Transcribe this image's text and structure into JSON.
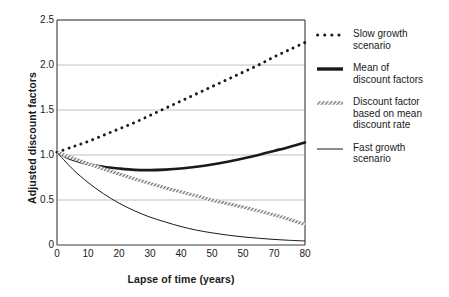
{
  "chart_data": {
    "type": "line",
    "title": "",
    "xlabel": "Lapse of time (years)",
    "ylabel": "Adjusted discount factors",
    "xlim": [
      0,
      80
    ],
    "ylim": [
      0,
      2.5
    ],
    "xticks": [
      0,
      10,
      20,
      30,
      40,
      50,
      60,
      70,
      80
    ],
    "xtick_labels": [
      "0",
      "10",
      "20",
      "30",
      "40",
      "50",
      "50",
      "70",
      "80"
    ],
    "yticks": [
      0,
      0.5,
      1.0,
      1.5,
      2.0,
      2.5
    ],
    "ytick_labels": [
      "0",
      "0.5",
      "1.0",
      "1.5",
      "2.0",
      "2.5"
    ],
    "grid": "horizontal",
    "grid_color": "#b0b0b0",
    "legend_position": "right",
    "x": [
      0,
      5,
      10,
      15,
      20,
      25,
      30,
      35,
      40,
      45,
      50,
      55,
      60,
      65,
      70,
      75,
      80
    ],
    "series": [
      {
        "name": "Slow growth scenario",
        "style": "dotted",
        "color": "#1a1a1a",
        "values": [
          1.03,
          1.09,
          1.15,
          1.22,
          1.29,
          1.36,
          1.44,
          1.52,
          1.6,
          1.68,
          1.76,
          1.84,
          1.92,
          2.0,
          2.09,
          2.17,
          2.25
        ]
      },
      {
        "name": "Mean of discount factors",
        "style": "thick-solid",
        "color": "#1a1a1a",
        "values": [
          1.03,
          0.95,
          0.9,
          0.87,
          0.85,
          0.835,
          0.832,
          0.838,
          0.85,
          0.87,
          0.895,
          0.925,
          0.96,
          1.0,
          1.045,
          1.09,
          1.14
        ]
      },
      {
        "name": "Discount factor based on mean discount rate",
        "style": "hatched",
        "color": "#8c8c8c",
        "values": [
          1.03,
          0.965,
          0.905,
          0.845,
          0.79,
          0.735,
          0.685,
          0.635,
          0.59,
          0.545,
          0.5,
          0.46,
          0.42,
          0.38,
          0.335,
          0.285,
          0.225
        ]
      },
      {
        "name": "Fast growth scenario",
        "style": "thin-solid",
        "color": "#1a1a1a",
        "values": [
          1.03,
          0.845,
          0.695,
          0.57,
          0.465,
          0.38,
          0.31,
          0.255,
          0.205,
          0.165,
          0.135,
          0.11,
          0.09,
          0.075,
          0.062,
          0.052,
          0.045
        ]
      }
    ]
  },
  "legend": {
    "items": [
      {
        "label": "Slow growth\nscenario",
        "swatch": "dotted-swatch"
      },
      {
        "label": "Mean of\ndiscount factors",
        "swatch": "thick-bar-swatch"
      },
      {
        "label": "Discount factor\nbased on mean\ndiscount rate",
        "swatch": "hatched-swatch"
      },
      {
        "label": "Fast growth\nscenario",
        "swatch": "thin-line-swatch"
      }
    ]
  }
}
